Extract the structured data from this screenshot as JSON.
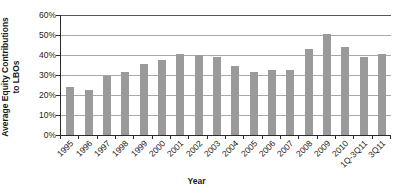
{
  "chart_data": {
    "type": "bar",
    "title": "",
    "xlabel": "Year",
    "ylabel": "Average Equity Contributions to LBOs",
    "ylabel_line1": "Average Equity Contributions",
    "ylabel_line2": "to LBOs",
    "categories": [
      "1995",
      "1996",
      "1997",
      "1998",
      "1999",
      "2000",
      "2001",
      "2002",
      "2003",
      "2004",
      "2005",
      "2006",
      "2007",
      "2008",
      "2009",
      "2010",
      "1Q-3Q11",
      "3Q11"
    ],
    "values": [
      23.8,
      22.7,
      29.5,
      31.5,
      35.6,
      37.7,
      40.7,
      39.9,
      38.8,
      34.7,
      31.6,
      32.7,
      32.7,
      42.8,
      50.7,
      43.8,
      38.9,
      40.6
    ],
    "ylim": [
      0,
      60
    ],
    "ytick_values": [
      0,
      10,
      20,
      30,
      40,
      50,
      60
    ],
    "ytick_labels": [
      "0%",
      "10%",
      "20%",
      "30%",
      "40%",
      "50%",
      "60%"
    ],
    "grid": true,
    "legend": "none",
    "bar_color": "#9a9a9a",
    "gridline_color": "#a9a9a9",
    "axis_color": "#2b2b2b"
  }
}
